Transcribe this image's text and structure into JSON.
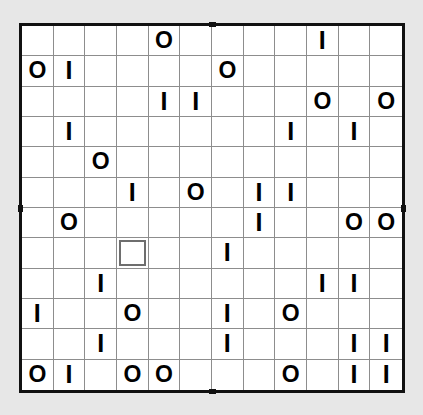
{
  "puzzle": {
    "type": "binairo-takuzu-grid",
    "rows": 12,
    "cols": 12,
    "symbol_zero": "O",
    "symbol_one": "I",
    "empty": "",
    "selected_cell": {
      "row": 8,
      "col": 4
    },
    "colors": {
      "page_background": "#e7e7e7",
      "cell_background": "#ffffff",
      "grid_line": "#8d8d8d",
      "outer_border": "#111111",
      "glyph": "#000000",
      "selection_border": "#6e6e6e"
    },
    "ticks": [
      "top-center",
      "bottom-center",
      "left-middle",
      "right-middle"
    ],
    "cells": [
      [
        "",
        "",
        "",
        "",
        "O",
        "",
        "",
        "",
        "",
        "I",
        "",
        ""
      ],
      [
        "O",
        "I",
        "",
        "",
        "",
        "",
        "O",
        "",
        "",
        "",
        "",
        ""
      ],
      [
        "",
        "",
        "",
        "",
        "I",
        "I",
        "",
        "",
        "",
        "O",
        "",
        "O"
      ],
      [
        "",
        "I",
        "",
        "",
        "",
        "",
        "",
        "",
        "I",
        "",
        "I",
        ""
      ],
      [
        "",
        "",
        "O",
        "",
        "",
        "",
        "",
        "",
        "",
        "",
        "",
        ""
      ],
      [
        "",
        "",
        "",
        "I",
        "",
        "O",
        "",
        "I",
        "I",
        "",
        "",
        ""
      ],
      [
        "",
        "O",
        "",
        "",
        "",
        "",
        "",
        "I",
        "",
        "",
        "O",
        "O"
      ],
      [
        "",
        "",
        "",
        "",
        "",
        "",
        "I",
        "",
        "",
        "",
        "",
        ""
      ],
      [
        "",
        "",
        "I",
        "",
        "",
        "",
        "",
        "",
        "",
        "I",
        "I",
        ""
      ],
      [
        "I",
        "",
        "",
        "O",
        "",
        "",
        "I",
        "",
        "O",
        "",
        "",
        ""
      ],
      [
        "",
        "",
        "I",
        "",
        "",
        "",
        "I",
        "",
        "",
        "",
        "I",
        "I"
      ],
      [
        "O",
        "I",
        "",
        "O",
        "O",
        "",
        "",
        "",
        "O",
        "",
        "I",
        "I"
      ]
    ]
  }
}
